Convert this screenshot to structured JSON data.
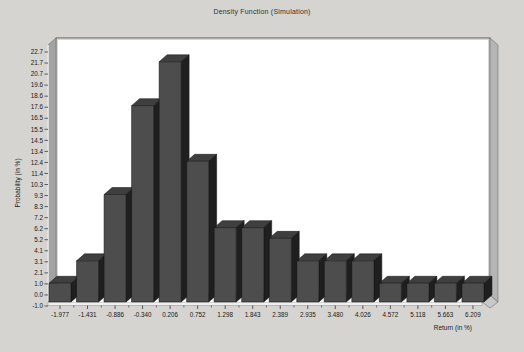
{
  "window": {
    "background_color": "#d5d4d0"
  },
  "chart_data": {
    "type": "bar",
    "style": "3d-histogram",
    "title": "Density Function (Simulation)",
    "xlabel": "Return (in %)",
    "ylabel": "Probability (in %)",
    "categories": [
      "-1.977",
      "-1.431",
      "-0.886",
      "-0.340",
      "0.206",
      "0.752",
      "1.298",
      "1.843",
      "2.389",
      "2.935",
      "3.480",
      "4.026",
      "4.572",
      "5.118",
      "5.663",
      "6.209"
    ],
    "values": [
      1.0,
      3.1,
      9.3,
      17.6,
      21.7,
      12.4,
      6.2,
      6.2,
      5.2,
      3.1,
      3.1,
      3.1,
      1.0,
      1.0,
      1.0,
      1.0
    ],
    "y_ticks": [
      "22.7",
      "21.7",
      "20.7",
      "19.6",
      "18.6",
      "17.6",
      "16.5",
      "15.5",
      "14.5",
      "13.4",
      "12.4",
      "11.4",
      "10.3",
      "9.3",
      "8.3",
      "7.2",
      "6.2",
      "5.2",
      "4.1",
      "3.1",
      "2.1",
      "1.0",
      "0.0",
      "-1.0"
    ],
    "ylim": [
      -1.0,
      22.7
    ],
    "grid": false,
    "legend_position": "none",
    "colors": {
      "bar_front": "#4d4d4d",
      "bar_side": "#1f1f1f",
      "bar_top": "#3f3f3f",
      "bar_outline": "#111111",
      "left_wall": "#a2a2a2",
      "right_wall": "#b5b5b5",
      "floor": "#b0b0b0",
      "floor_front": "#efefef",
      "plot_bg": "#ffffff",
      "frame": "#555555",
      "tick": "#222222",
      "label_text": "#1a1a1a"
    }
  }
}
